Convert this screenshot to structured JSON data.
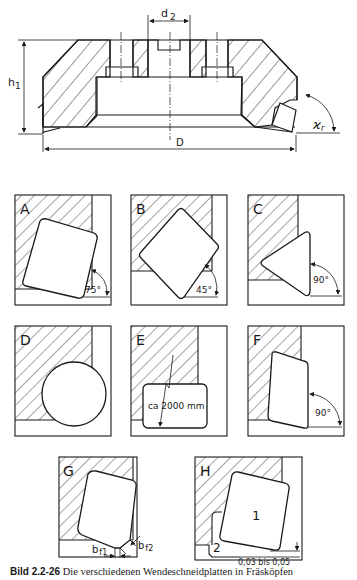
{
  "figure": {
    "caption_number": "Bild 2.2-26",
    "caption_text": "Die verschiedenen Wendeschneidplatten in Fräsköpfen",
    "top_view": {
      "labels": {
        "bore_diameter": "d",
        "bore_diameter_sub": "2",
        "height": "h",
        "height_sub": "1",
        "diameter": "D",
        "setting_angle": "ϰ",
        "setting_angle_sub": "r"
      }
    },
    "panels": [
      {
        "letter": "A",
        "insert": "square, tilted",
        "angle": "75°"
      },
      {
        "letter": "B",
        "insert": "square, 45°",
        "angle": "45°"
      },
      {
        "letter": "C",
        "insert": "triangle",
        "angle": "90°"
      },
      {
        "letter": "D",
        "insert": "round",
        "angle": ""
      },
      {
        "letter": "E",
        "insert": "large-radius edge",
        "annotation": "ca 2000 mm"
      },
      {
        "letter": "F",
        "insert": "parallelogram",
        "angle": "90°"
      },
      {
        "letter": "G",
        "insert": "square with wiper flats",
        "dim1": "b",
        "dim1_sub": "f1",
        "dim2": "b",
        "dim2_sub": "f2"
      },
      {
        "letter": "H",
        "insert": "main + wiper insert",
        "label_main": "1",
        "label_wiper": "2",
        "offset": "0,03 bis 0,05"
      }
    ],
    "colors": {
      "ink": "#1a1a1a",
      "paper": "#ffffff"
    }
  }
}
